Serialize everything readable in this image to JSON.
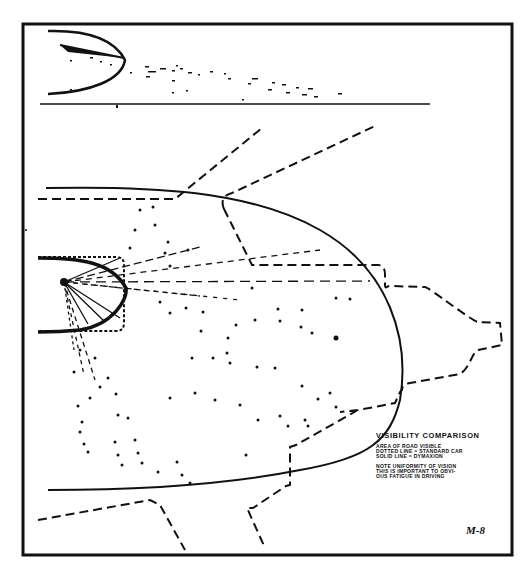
{
  "figure": {
    "type": "visibility comparison diagram (scanned drawing)",
    "plate_number": "M-8",
    "legend": {
      "title": "VISIBILITY COMPARISON",
      "lines": [
        "AREA OF ROAD VISIBLE",
        "DOTTED LINE = STANDARD CAR",
        "SOLID LINE = DYMAXION"
      ],
      "note_lines": [
        "NOTE UNIFORMITY OF VISION",
        "THIS IS IMPORTANT TO OBVI-",
        "OUS FATIGUE IN DRIVING"
      ]
    },
    "colors": {
      "ink": "#111111",
      "paper": "#ffffff"
    },
    "panels": [
      {
        "name": "side-view",
        "description": "Side elevation: solid parabolic nose outline with sight lines fanning right to ground line"
      },
      {
        "name": "plan-view",
        "description": "Plan view: solid parabolic visibility envelope vs dashed standard-car envelope, radial sight lines from driver position, scattered dots"
      }
    ]
  }
}
